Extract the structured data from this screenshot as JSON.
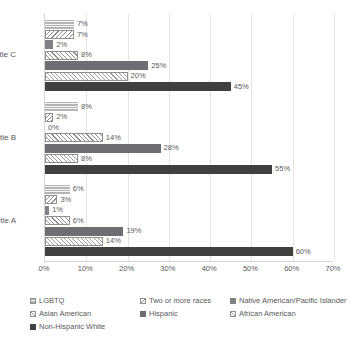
{
  "chart_data": {
    "type": "bar",
    "orientation": "horizontal",
    "title": "",
    "xlabel": "",
    "ylabel": "",
    "xlim": [
      0,
      70
    ],
    "xtick_labels": [
      "0%",
      "10%",
      "20%",
      "30%",
      "40%",
      "50%",
      "60%",
      "70%"
    ],
    "xtick_values": [
      0,
      10,
      20,
      30,
      40,
      50,
      60,
      70
    ],
    "grid": "vertical",
    "legend_position": "bottom",
    "categories": [
      "Title C",
      "Title B",
      "Title A"
    ],
    "series": [
      {
        "name": "LGBTQ",
        "values": [
          7,
          8,
          6
        ],
        "labels": [
          "7%",
          "8%",
          "6%"
        ],
        "pattern": "horizontal-lines",
        "color": "#b4b5b7"
      },
      {
        "name": "Two or more races",
        "values": [
          7,
          2,
          3
        ],
        "labels": [
          "7%",
          "2%",
          "3%"
        ],
        "pattern": "diagonal-stripes-back",
        "color": "#ffffff"
      },
      {
        "name": "Native American/Pacific Islander",
        "values": [
          2,
          0,
          1
        ],
        "labels": [
          "2%",
          "0%",
          "1%"
        ],
        "pattern": "solid",
        "color": "#808285"
      },
      {
        "name": "Asian American",
        "values": [
          8,
          14,
          6
        ],
        "labels": [
          "8%",
          "14%",
          "6%"
        ],
        "pattern": "diagonal-stripes-fwd",
        "color": "#ffffff"
      },
      {
        "name": "Hispanic",
        "values": [
          25,
          28,
          19
        ],
        "labels": [
          "25%",
          "28%",
          "19%"
        ],
        "pattern": "solid",
        "color": "#6d6e71"
      },
      {
        "name": "African American",
        "values": [
          20,
          8,
          14
        ],
        "labels": [
          "20%",
          "8%",
          "14%"
        ],
        "pattern": "crosshatch",
        "color": "#ffffff"
      },
      {
        "name": "Non-Hispanic White",
        "values": [
          45,
          55,
          60
        ],
        "labels": [
          "45%",
          "55%",
          "60%"
        ],
        "pattern": "solid",
        "color": "#404041"
      }
    ]
  },
  "legend": {
    "items": [
      {
        "label": "LGBTQ"
      },
      {
        "label": "Two or more races"
      },
      {
        "label": "Native American/Pacific Islander"
      },
      {
        "label": "Asian American"
      },
      {
        "label": "Hispanic"
      },
      {
        "label": "African American"
      },
      {
        "label": "Non-Hispanic White"
      }
    ]
  }
}
